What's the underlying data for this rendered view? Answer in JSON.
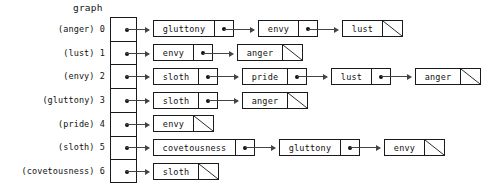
{
  "title": "graph",
  "colors": {
    "ink": "#1a1a1a",
    "arrow": "#444444",
    "background": "#ffffff"
  },
  "nil_marker": "diagonal-slash",
  "adjacency_list": {
    "rows": [
      {
        "index": "0",
        "name": "(anger)",
        "label": "(anger) 0",
        "nodes": [
          "gluttony",
          "envy",
          "lust"
        ]
      },
      {
        "index": "1",
        "name": "(lust)",
        "label": "(lust) 1",
        "nodes": [
          "envy",
          "anger"
        ]
      },
      {
        "index": "2",
        "name": "(envy)",
        "label": "(envy) 2",
        "nodes": [
          "sloth",
          "pride",
          "lust",
          "anger"
        ]
      },
      {
        "index": "3",
        "name": "(gluttony)",
        "label": "(gluttony) 3",
        "nodes": [
          "sloth",
          "anger"
        ]
      },
      {
        "index": "4",
        "name": "(pride)",
        "label": "(pride) 4",
        "nodes": [
          "envy"
        ]
      },
      {
        "index": "5",
        "name": "(sloth)",
        "label": "(sloth) 5",
        "nodes": [
          "covetousness",
          "gluttony",
          "envy"
        ]
      },
      {
        "index": "6",
        "name": "(covetousness)",
        "label": "(covetousness) 6",
        "nodes": [
          "sloth"
        ]
      }
    ]
  }
}
